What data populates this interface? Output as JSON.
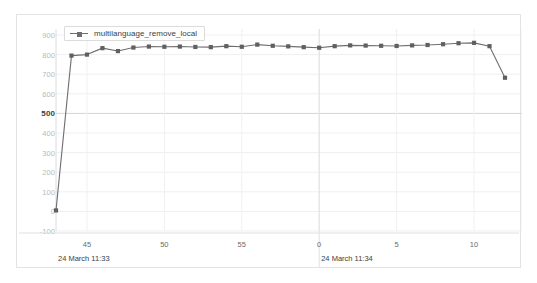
{
  "chart_data": {
    "type": "line",
    "title": "",
    "subtitle": "",
    "xlabel": "",
    "ylabel": "",
    "grid": true,
    "legend_position": "top-left",
    "ylim": [
      -100,
      900
    ],
    "yticks": [
      900,
      800,
      700,
      600,
      500,
      400,
      300,
      200,
      100,
      0,
      -100
    ],
    "ytick_labels": [
      "900",
      "800",
      "700",
      "600",
      "500",
      "400",
      "300",
      "200",
      "100",
      "0",
      "-100"
    ],
    "y_major_tick": "500",
    "xlim": [
      43,
      72
    ],
    "xticks": [
      45,
      50,
      55,
      60,
      65,
      70
    ],
    "xtick_labels": [
      "45",
      "50",
      "55",
      "0",
      "5",
      "10"
    ],
    "x_group_labels": [
      "24 March 11:33",
      "24 March 11:34"
    ],
    "x_group_boundary": 60,
    "line_color": "#6e6e6e",
    "marker_color": "#606060",
    "marker_shape": "square",
    "series": [
      {
        "name": "multilanguage_remove_local",
        "x": [
          43,
          44,
          45,
          46,
          47,
          48,
          49,
          50,
          51,
          52,
          53,
          54,
          55,
          56,
          57,
          58,
          59,
          60,
          61,
          62,
          63,
          64,
          65,
          66,
          67,
          68,
          69,
          70,
          71,
          72
        ],
        "values": [
          5,
          795,
          800,
          833,
          818,
          836,
          841,
          840,
          841,
          839,
          838,
          843,
          840,
          851,
          845,
          842,
          838,
          835,
          843,
          847,
          846,
          845,
          844,
          847,
          849,
          853,
          858,
          860,
          843,
          682
        ]
      }
    ]
  },
  "legend": {
    "entries": [
      {
        "label": "multilanguage_remove_local",
        "color": "#6e6e6e"
      }
    ]
  }
}
